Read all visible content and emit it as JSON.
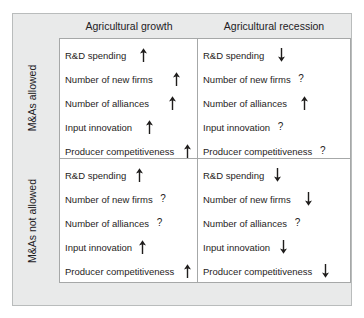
{
  "figure": {
    "columns": [
      {
        "id": "growth",
        "label": "Agricultural growth"
      },
      {
        "id": "recession",
        "label": "Agricultural recession"
      }
    ],
    "rows": [
      {
        "id": "allowed",
        "label": "M&As allowed"
      },
      {
        "id": "not-allowed",
        "label": "M&As not allowed"
      }
    ],
    "colors": {
      "plate_background": "#e9eaea",
      "plate_border": "#b9bcbc",
      "matrix_background": "#ffffff",
      "matrix_border": "#a6a8a8",
      "text": "#1f1d1c"
    },
    "marks": {
      "up": "up-arrow",
      "down": "down-arrow",
      "unknown": "?"
    },
    "quadrants": [
      {
        "id": "allowed-growth",
        "row": "M&As allowed",
        "column": "Agricultural growth",
        "items": [
          {
            "label": "R&D spending",
            "mark": "up",
            "gap": 3
          },
          {
            "label": "Number of new firms",
            "mark": "up",
            "gap": 4
          },
          {
            "label": "Number of alliances",
            "mark": "up",
            "gap": 4
          },
          {
            "label": "Input innovation",
            "mark": "up",
            "gap": 3
          },
          {
            "label": "Producer competitiveness",
            "mark": "up",
            "gap": 2
          }
        ]
      },
      {
        "id": "allowed-recession",
        "row": "M&As allowed",
        "column": "Agricultural recession",
        "items": [
          {
            "label": "R&D spending",
            "mark": "down",
            "gap": 3
          },
          {
            "label": "Number of new firms",
            "mark": "unknown",
            "gap": 1
          },
          {
            "label": "Number of alliances",
            "mark": "up",
            "gap": 3
          },
          {
            "label": "Input innovation",
            "mark": "unknown",
            "gap": 1
          },
          {
            "label": "Producer competitiveness",
            "mark": "unknown",
            "gap": 1
          }
        ]
      },
      {
        "id": "not-allowed-growth",
        "row": "M&As not allowed",
        "column": "Agricultural growth",
        "items": [
          {
            "label": "R&D spending",
            "mark": "up",
            "gap": 2
          },
          {
            "label": "Number of new firms",
            "mark": "unknown",
            "gap": 1
          },
          {
            "label": "Number of alliances",
            "mark": "unknown",
            "gap": 1
          },
          {
            "label": "Input innovation",
            "mark": "up",
            "gap": 1
          },
          {
            "label": "Producer competitiveness",
            "mark": "up",
            "gap": 2
          }
        ]
      },
      {
        "id": "not-allowed-recession",
        "row": "M&As not allowed",
        "column": "Agricultural recession",
        "items": [
          {
            "label": "R&D spending",
            "mark": "down",
            "gap": 2
          },
          {
            "label": "Number of new firms",
            "mark": "down",
            "gap": 3
          },
          {
            "label": "Number of alliances",
            "mark": "unknown",
            "gap": 1
          },
          {
            "label": "Input innovation",
            "mark": "down",
            "gap": 2
          },
          {
            "label": "Producer competitiveness",
            "mark": "down",
            "gap": 2
          }
        ]
      }
    ]
  }
}
